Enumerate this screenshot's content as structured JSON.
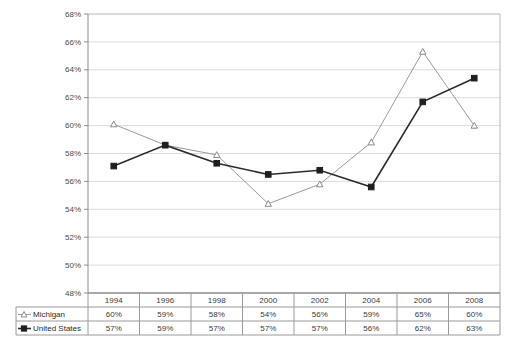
{
  "chart_data": {
    "type": "line",
    "title": "",
    "subtitle": "",
    "xlabel": "",
    "ylabel": "",
    "categories": [
      "1994",
      "1996",
      "1998",
      "2000",
      "2002",
      "2004",
      "2006",
      "2008"
    ],
    "ylim": [
      48,
      68
    ],
    "ytick_step": 2,
    "yticks": [
      "48%",
      "50%",
      "52%",
      "54%",
      "56%",
      "58%",
      "60%",
      "62%",
      "64%",
      "66%",
      "68%"
    ],
    "ytick_values": [
      48,
      50,
      52,
      54,
      56,
      58,
      60,
      62,
      64,
      66,
      68
    ],
    "grid": true,
    "grid_axis": "y",
    "legend_position": "table-left",
    "series": [
      {
        "name": "Michigan",
        "marker": "open-triangle",
        "line_color": "#9a9a9a",
        "marker_color": "#ffffff",
        "marker_edge_color": "#8a8a8a",
        "values": [
          60.1,
          58.6,
          57.9,
          54.4,
          55.8,
          58.8,
          65.3,
          60.0
        ],
        "labels": [
          "60%",
          "59%",
          "58%",
          "54%",
          "56%",
          "59%",
          "65%",
          "60%"
        ]
      },
      {
        "name": "United States",
        "marker": "filled-square",
        "line_color": "#2b2b2b",
        "marker_color": "#1f1f1f",
        "marker_edge_color": "#1f1f1f",
        "values": [
          57.1,
          58.6,
          57.3,
          56.5,
          56.8,
          55.6,
          61.7,
          63.4
        ],
        "labels": [
          "57%",
          "59%",
          "57%",
          "57%",
          "57%",
          "56%",
          "62%",
          "63%"
        ]
      }
    ]
  },
  "table": {
    "header_label": "",
    "year_headers": [
      "1994",
      "1996",
      "1998",
      "2000",
      "2002",
      "2004",
      "2006",
      "2008"
    ],
    "rows": [
      {
        "label": "Michigan",
        "marker": "open-triangle",
        "values": [
          "60%",
          "59%",
          "58%",
          "54%",
          "56%",
          "59%",
          "65%",
          "60%"
        ]
      },
      {
        "label": "United States",
        "marker": "filled-square",
        "values": [
          "57%",
          "59%",
          "57%",
          "57%",
          "57%",
          "56%",
          "62%",
          "63%"
        ]
      }
    ]
  },
  "colors": {
    "plot_border": "#8c8c8c",
    "gridline": "#dcdcdc",
    "table_border": "#9a9a9a",
    "background": "#ffffff",
    "michigan_line": "#9a9a9a",
    "us_line": "#2b2b2b"
  }
}
